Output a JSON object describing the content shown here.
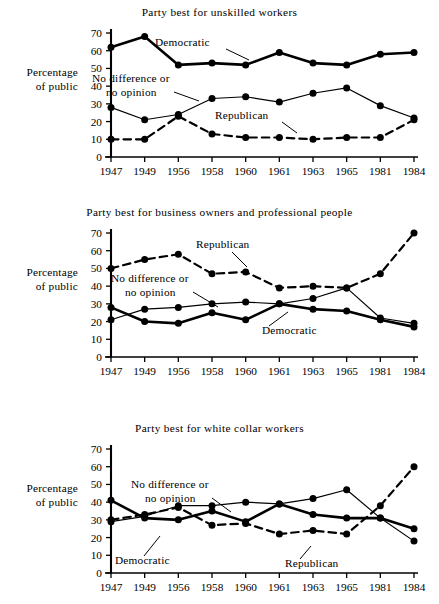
{
  "figure": {
    "y_axis_label_line1": "Percentage",
    "y_axis_label_line2": "of public"
  },
  "chart_data": [
    {
      "type": "line",
      "title": "Party best for unskilled workers",
      "xlabel": "",
      "ylabel": "Percentage of public",
      "categories": [
        "1947",
        "1949",
        "1956",
        "1958",
        "1960",
        "1961",
        "1963",
        "1965",
        "1981",
        "1984"
      ],
      "yticks": [
        0,
        10,
        20,
        30,
        40,
        50,
        60,
        70
      ],
      "ylim": [
        0,
        70
      ],
      "grid": false,
      "legend": "inline-annotations",
      "series": [
        {
          "name": "Democratic",
          "style": "thick-solid",
          "values": [
            62,
            68,
            52,
            53,
            52,
            59,
            53,
            52,
            58,
            59
          ]
        },
        {
          "name": "No difference or no opinion",
          "style": "thin-solid",
          "values": [
            28,
            21,
            24,
            33,
            34,
            31,
            36,
            39,
            29,
            22
          ]
        },
        {
          "name": "Republican",
          "style": "dashed",
          "values": [
            10,
            10,
            23,
            13,
            11,
            11,
            10,
            11,
            11,
            21
          ]
        }
      ]
    },
    {
      "type": "line",
      "title": "Party best for business owners and professional people",
      "xlabel": "",
      "ylabel": "Percentage of public",
      "categories": [
        "1947",
        "1949",
        "1956",
        "1958",
        "1960",
        "1961",
        "1963",
        "1965",
        "1981",
        "1984"
      ],
      "yticks": [
        0,
        10,
        20,
        30,
        40,
        50,
        60,
        70
      ],
      "ylim": [
        0,
        70
      ],
      "grid": false,
      "legend": "inline-annotations",
      "series": [
        {
          "name": "Republican",
          "style": "dashed",
          "values": [
            50,
            55,
            58,
            47,
            48,
            39,
            40,
            39,
            47,
            70
          ]
        },
        {
          "name": "No difference or no opinion",
          "style": "thin-solid",
          "values": [
            21,
            27,
            28,
            30,
            31,
            30,
            33,
            39,
            22,
            19
          ]
        },
        {
          "name": "Democratic",
          "style": "thick-solid",
          "values": [
            28,
            20,
            19,
            25,
            21,
            30,
            27,
            26,
            21,
            17
          ]
        }
      ]
    },
    {
      "type": "line",
      "title": "Party best for white collar workers",
      "xlabel": "",
      "ylabel": "Percentage of public",
      "categories": [
        "1947",
        "1949",
        "1956",
        "1958",
        "1960",
        "1961",
        "1963",
        "1965",
        "1981",
        "1984"
      ],
      "yticks": [
        0,
        10,
        20,
        30,
        40,
        50,
        60,
        70
      ],
      "ylim": [
        0,
        70
      ],
      "grid": false,
      "legend": "inline-annotations",
      "series": [
        {
          "name": "No difference or no opinion",
          "style": "thin-solid",
          "values": [
            29,
            32,
            38,
            38,
            40,
            39,
            42,
            47,
            31,
            18
          ]
        },
        {
          "name": "Democratic",
          "style": "thick-solid",
          "values": [
            41,
            31,
            30,
            35,
            29,
            39,
            33,
            31,
            31,
            25
          ]
        },
        {
          "name": "Republican",
          "style": "dashed",
          "values": [
            30,
            33,
            37,
            27,
            28,
            22,
            24,
            22,
            38,
            60
          ]
        }
      ]
    }
  ],
  "annotations": [
    {
      "panel": 0,
      "text": "Democratic"
    },
    {
      "panel": 0,
      "text": "No difference or"
    },
    {
      "panel": 0,
      "text": "no opinion"
    },
    {
      "panel": 0,
      "text": "Republican"
    },
    {
      "panel": 1,
      "text": "Republican"
    },
    {
      "panel": 1,
      "text": "No difference or"
    },
    {
      "panel": 1,
      "text": "no opinion"
    },
    {
      "panel": 1,
      "text": "Democratic"
    },
    {
      "panel": 2,
      "text": "No difference or"
    },
    {
      "panel": 2,
      "text": "no opinion"
    },
    {
      "panel": 2,
      "text": "Democratic"
    },
    {
      "panel": 2,
      "text": "Republican"
    }
  ]
}
